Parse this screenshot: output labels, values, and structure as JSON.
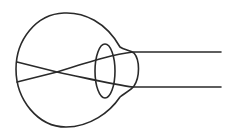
{
  "diagram": {
    "stroke_color": "#2a2a2a",
    "background": "#ffffff",
    "elements": [
      "eyeball",
      "cornea",
      "lens",
      "light-ray-top",
      "light-ray-bottom"
    ]
  }
}
